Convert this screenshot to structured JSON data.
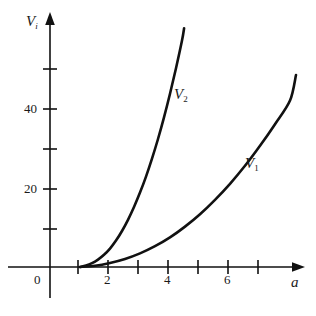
{
  "chart_data": {
    "type": "line",
    "title": "",
    "subtitle": "",
    "xlabel": "a",
    "ylabel": "V_i",
    "xlim": [
      0,
      8.7
    ],
    "ylim": [
      0,
      62
    ],
    "grid": false,
    "legend": "inline-curve-labels",
    "x_ticks": [
      {
        "value": 1,
        "label": ""
      },
      {
        "value": 2,
        "label": "2"
      },
      {
        "value": 3,
        "label": ""
      },
      {
        "value": 4,
        "label": "4"
      },
      {
        "value": 5,
        "label": ""
      },
      {
        "value": 6,
        "label": "6"
      },
      {
        "value": 7,
        "label": ""
      }
    ],
    "y_ticks": [
      {
        "value": 10,
        "label": ""
      },
      {
        "value": 20,
        "label": "20"
      },
      {
        "value": 30,
        "label": ""
      },
      {
        "value": 40,
        "label": "40"
      },
      {
        "value": 50,
        "label": ""
      }
    ],
    "origin_label": "0",
    "series": [
      {
        "name": "V_2",
        "label": "V",
        "subscript": "2",
        "color": "#111111",
        "x": [
          1.0,
          1.2,
          1.4,
          1.6,
          1.8,
          2.0,
          2.2,
          2.4,
          2.6,
          2.8,
          3.0,
          3.2,
          3.4,
          3.6,
          3.8,
          4.0,
          4.2,
          4.4,
          4.47
        ],
        "y": [
          0.0,
          0.35,
          0.95,
          1.85,
          3.05,
          4.6,
          6.6,
          9.0,
          11.8,
          15.0,
          18.6,
          22.6,
          27.1,
          32.0,
          37.4,
          43.3,
          49.7,
          56.6,
          59.7
        ]
      },
      {
        "name": "V_1",
        "label": "V",
        "subscript": "1",
        "color": "#111111",
        "x": [
          1.0,
          1.5,
          2.0,
          2.5,
          3.0,
          3.5,
          4.0,
          4.5,
          5.0,
          5.5,
          6.0,
          6.5,
          7.0,
          7.5,
          8.0,
          8.2
        ],
        "y": [
          0.0,
          0.3,
          1.0,
          2.0,
          3.4,
          5.2,
          7.4,
          10.1,
          13.2,
          16.8,
          20.8,
          25.3,
          30.3,
          35.7,
          41.6,
          48.0
        ]
      }
    ],
    "annotations": [
      {
        "name": "curve-label-v2",
        "text": "V2",
        "x": 4.2,
        "y": 54
      },
      {
        "name": "curve-label-v1",
        "text": "V1",
        "x": 7.5,
        "y": 29
      }
    ]
  },
  "axes": {
    "y_axis_title": "V",
    "y_axis_subscript": "i",
    "x_axis_title": "a",
    "origin": "0",
    "y_tick_labels": {
      "t20": "20",
      "t40": "40"
    },
    "x_tick_labels": {
      "t2": "2",
      "t4": "4",
      "t6": "6"
    }
  }
}
